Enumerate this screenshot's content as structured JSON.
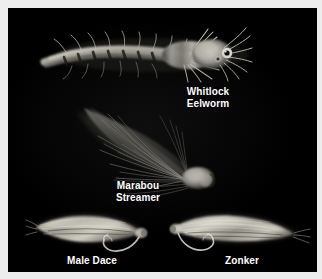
{
  "image": {
    "kind": "photograph",
    "subject": "streamer-fishing-flies",
    "background_color": "#000000",
    "frame_color": "#ededed",
    "caption_color": "#ffffff",
    "width": 322,
    "height": 279
  },
  "flies": [
    {
      "id": "whitlock-eelworm",
      "caption": "Whitlock\nEelworm",
      "description": "Long pale barred rabbit-strip eelworm streamer with bushy head and bead eyes, tail sweeping to the left",
      "tone": "light-gray",
      "orientation": "head-right"
    },
    {
      "id": "marabou-streamer",
      "caption": "Marabou\nStreamer",
      "description": "Large fan of soft gray marabou plumes sweeping up and to the left from a bright conical head at lower right",
      "tone": "mid-gray",
      "orientation": "head-right"
    },
    {
      "id": "male-dace",
      "caption": "Male Dace",
      "description": "Slim pale hair-wing streamer tapering to the right with exposed hook bend below",
      "tone": "light-gray",
      "orientation": "head-right"
    },
    {
      "id": "zonker",
      "caption": "Zonker",
      "description": "Pale zonker strip streamer tapering to the right with exposed hook bend below at the left",
      "tone": "light-gray",
      "orientation": "head-left"
    }
  ]
}
